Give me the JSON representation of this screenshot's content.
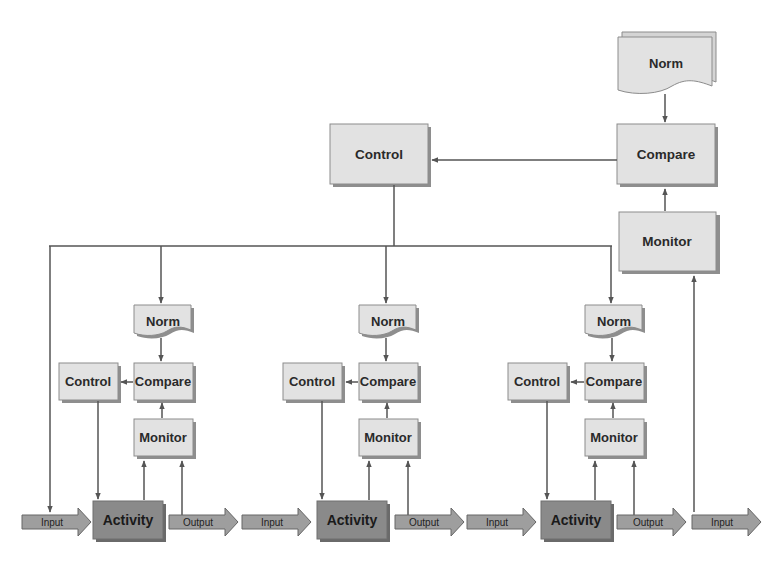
{
  "diagram": {
    "type": "hierarchical control loop flowchart",
    "colors": {
      "box_fill": "#e2e2e2",
      "box_border": "#8c8c8c",
      "box_shadow": "#8e8e8e",
      "activity_fill": "#8a8a8a",
      "flow_arrow_fill": "#9e9e9e",
      "line": "#555555"
    },
    "top_level": {
      "norm": "Norm",
      "compare": "Compare",
      "control": "Control",
      "monitor": "Monitor"
    },
    "units": [
      {
        "norm": "Norm",
        "compare": "Compare",
        "control": "Control",
        "monitor": "Monitor",
        "activity": "Activity",
        "input": "Input",
        "output": "Output"
      },
      {
        "norm": "Norm",
        "compare": "Compare",
        "control": "Control",
        "monitor": "Monitor",
        "activity": "Activity",
        "input": "Input",
        "output": "Output"
      },
      {
        "norm": "Norm",
        "compare": "Compare",
        "control": "Control",
        "monitor": "Monitor",
        "activity": "Activity",
        "input": "Input",
        "output": "Output"
      }
    ],
    "final_input": "Input",
    "connections": [
      "Top Norm -> Top Compare",
      "Top Monitor -> Top Compare",
      "Top Compare -> Top Control",
      "Top Control -> Unit 1..3 Norm (via horizontal bus)",
      "Top Control bus -> Unit 1 Input",
      "Unit Norm -> Unit Compare",
      "Unit Monitor -> Unit Compare",
      "Unit Compare -> Unit Control",
      "Unit Control -> Unit Activity",
      "Unit Activity -> Unit Monitor",
      "Unit Output -> Unit Monitor",
      "Final Input -> Top Monitor"
    ]
  }
}
